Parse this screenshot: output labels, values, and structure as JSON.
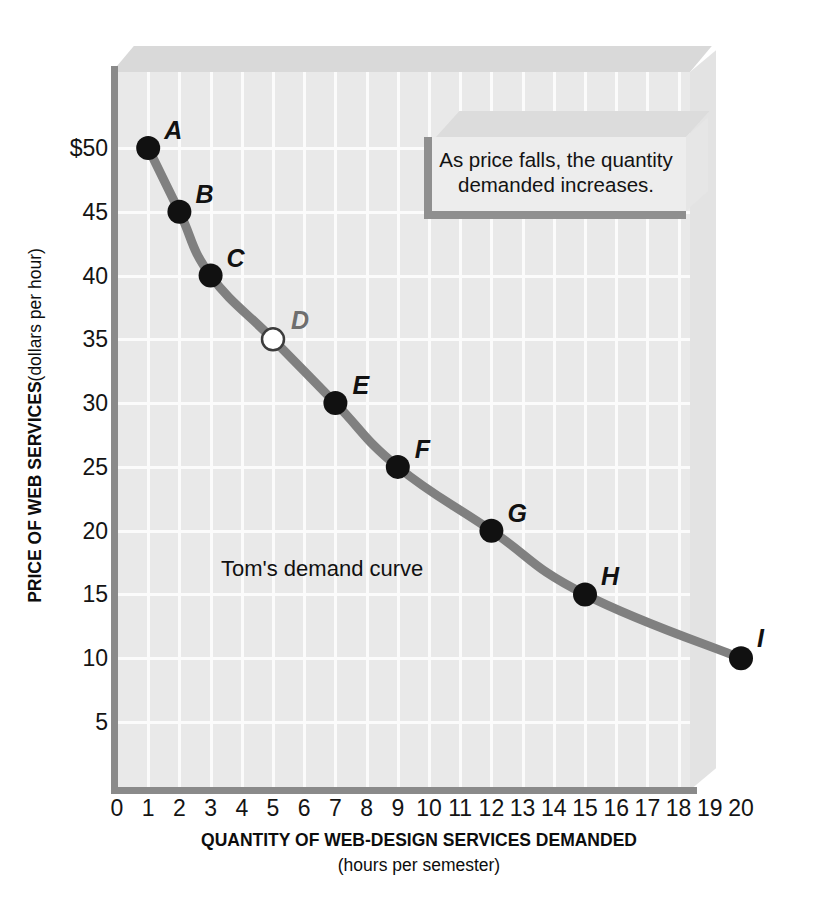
{
  "chart_data": {
    "type": "line",
    "title": "",
    "subtitle": "",
    "xlabel": "QUANTITY OF WEB-DESIGN SERVICES DEMANDED",
    "xsublabel": "(hours per semester)",
    "ylabel_main": "PRICE OF WEB SERVICES",
    "ylabel_sub": "(dollars per hour)",
    "xlim": [
      0,
      20
    ],
    "ylim": [
      0,
      52
    ],
    "grid": true,
    "legend_position": "none",
    "xticks": [
      "0",
      "1",
      "2",
      "3",
      "4",
      "5",
      "6",
      "7",
      "8",
      "9",
      "10",
      "11",
      "12",
      "13",
      "14",
      "15",
      "16",
      "17",
      "18",
      "19",
      "20"
    ],
    "xtick_values": [
      0,
      1,
      2,
      3,
      4,
      5,
      6,
      7,
      8,
      9,
      10,
      11,
      12,
      13,
      14,
      15,
      16,
      17,
      18,
      19,
      20
    ],
    "yticks": [
      "$50",
      "45",
      "40",
      "35",
      "30",
      "25",
      "20",
      "15",
      "10",
      "5"
    ],
    "ytick_values": [
      50,
      45,
      40,
      35,
      30,
      25,
      20,
      15,
      10,
      5
    ],
    "series": [
      {
        "name": "Tom's demand curve",
        "color": "#808080",
        "x": [
          1,
          2,
          3,
          5,
          7,
          9,
          12,
          15,
          20
        ],
        "y": [
          50,
          45,
          40,
          35,
          30,
          25,
          20,
          15,
          10
        ],
        "points": [
          {
            "label": "A",
            "x": 1,
            "y": 50,
            "style": "filled",
            "label_dx": 16,
            "label_dy": -30
          },
          {
            "label": "B",
            "x": 2,
            "y": 45,
            "style": "filled",
            "label_dx": 16,
            "label_dy": -30
          },
          {
            "label": "C",
            "x": 3,
            "y": 40,
            "style": "filled",
            "label_dx": 16,
            "label_dy": -30
          },
          {
            "label": "D",
            "x": 5,
            "y": 35,
            "style": "open",
            "label_dx": 18,
            "label_dy": -31
          },
          {
            "label": "E",
            "x": 7,
            "y": 30,
            "style": "filled",
            "label_dx": 17,
            "label_dy": -30
          },
          {
            "label": "F",
            "x": 9,
            "y": 25,
            "style": "filled",
            "label_dx": 17,
            "label_dy": -30
          },
          {
            "label": "G",
            "x": 12,
            "y": 20,
            "style": "filled",
            "label_dx": 16,
            "label_dy": -30
          },
          {
            "label": "H",
            "x": 15,
            "y": 15,
            "style": "filled",
            "label_dx": 16,
            "label_dy": -30
          },
          {
            "label": "I",
            "x": 20,
            "y": 10,
            "style": "filled",
            "label_dx": 16,
            "label_dy": -32
          }
        ]
      }
    ],
    "annotations": [
      {
        "name": "callout",
        "text": "As price falls, the quantity demanded increases."
      },
      {
        "name": "curve-caption",
        "text": "Tom's demand curve"
      }
    ],
    "colors": {
      "curve": "#808080",
      "point_fill": "#111111",
      "point_open_fill": "#ffffff",
      "point_open_stroke": "#3c3c3c",
      "axis": "#8a8a8a",
      "plot_background": "#e9e9e9",
      "gridline": "#fbfbfb",
      "text": "#111111"
    }
  },
  "callout": {
    "line1": "As price falls, the quantity",
    "line2": "demanded increases."
  },
  "curve_caption": "Tom's demand curve"
}
